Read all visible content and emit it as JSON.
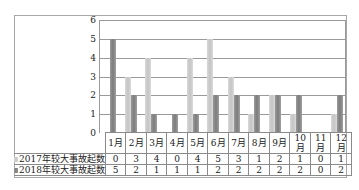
{
  "chart_data": {
    "type": "bar",
    "title": "",
    "xlabel": "",
    "ylabel": "",
    "ylim": [
      0,
      6
    ],
    "yticks": [
      "0",
      "1",
      "2",
      "3",
      "4",
      "5",
      "6"
    ],
    "grid": true,
    "legend_position": "data-table",
    "categories": [
      "1月",
      "2月",
      "3月",
      "4月",
      "5月",
      "6月",
      "7月",
      "8月",
      "9月",
      "10月",
      "11月",
      "12月"
    ],
    "series": [
      {
        "name": "2017年较大事故起数",
        "color": "#c8c8c8",
        "values": [
          0,
          3,
          4,
          0,
          4,
          5,
          3,
          1,
          2,
          1,
          0,
          1
        ]
      },
      {
        "name": "2018年较大事故起数",
        "color": "#858585",
        "values": [
          5,
          2,
          1,
          1,
          1,
          2,
          2,
          2,
          2,
          2,
          0,
          2
        ]
      }
    ]
  },
  "table": {
    "rows": [
      {
        "label": "2017年较大事故起数",
        "values": [
          "0",
          "3",
          "4",
          "0",
          "4",
          "5",
          "3",
          "1",
          "2",
          "1",
          "0",
          "1"
        ]
      },
      {
        "label": "2018年较大事故起数",
        "values": [
          "5",
          "2",
          "1",
          "1",
          "1",
          "2",
          "2",
          "2",
          "2",
          "2",
          "0",
          "2"
        ]
      }
    ]
  }
}
